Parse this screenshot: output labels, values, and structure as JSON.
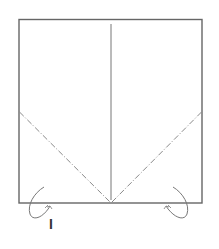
{
  "diagram": {
    "type": "origami-fold-diagram",
    "step_label": "I",
    "paper": {
      "shape": "square",
      "outline_color": "#666666",
      "fill_color": "#ffffff"
    },
    "lines": [
      {
        "name": "center-crease",
        "style": "solid",
        "color": "#777777"
      },
      {
        "name": "left-diagonal-fold",
        "style": "dash-dot",
        "color": "#999999"
      },
      {
        "name": "right-diagonal-fold",
        "style": "dash-dot",
        "color": "#999999"
      }
    ],
    "arrows": [
      {
        "name": "left-fold-arrow",
        "direction": "fold-behind",
        "side": "left"
      },
      {
        "name": "right-fold-arrow",
        "direction": "fold-behind",
        "side": "right"
      }
    ]
  }
}
